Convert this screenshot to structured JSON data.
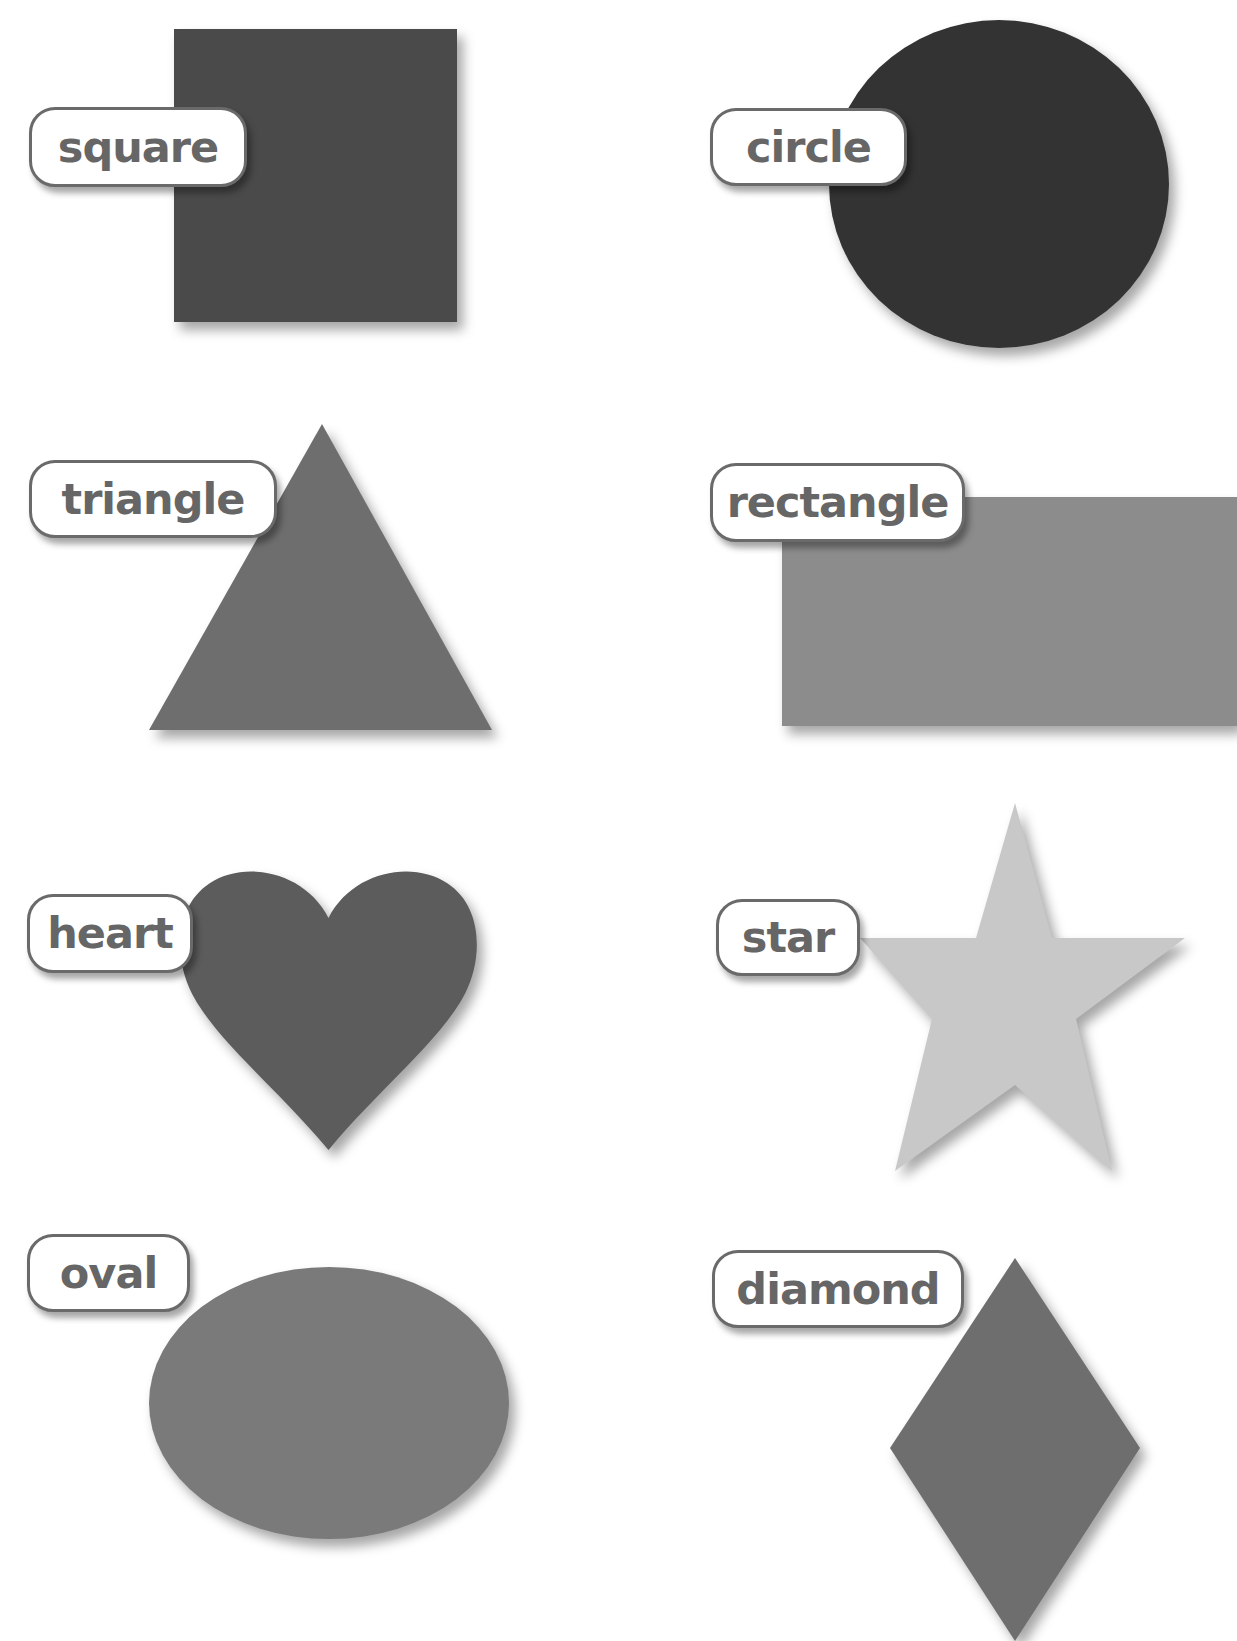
{
  "shapes": [
    {
      "id": "square",
      "label": "square",
      "color": "#4a4a4a"
    },
    {
      "id": "circle",
      "label": "circle",
      "color": "#333333"
    },
    {
      "id": "triangle",
      "label": "triangle",
      "color": "#6e6e6e"
    },
    {
      "id": "rectangle",
      "label": "rectangle",
      "color": "#8c8c8c"
    },
    {
      "id": "heart",
      "label": "heart",
      "color": "#5c5c5c"
    },
    {
      "id": "star",
      "label": "star",
      "color": "#c8c8c8"
    },
    {
      "id": "oval",
      "label": "oval",
      "color": "#7a7a7a"
    },
    {
      "id": "diamond",
      "label": "diamond",
      "color": "#6e6e6e"
    }
  ]
}
